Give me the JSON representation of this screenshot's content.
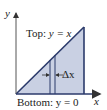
{
  "diagram": {
    "axes": {
      "x_label": "x",
      "y_label": "y"
    },
    "region": {
      "description": "triangle between y = x and y = 0",
      "fill_color": "#c9d0e3",
      "edge_color": "#2b3a6b"
    },
    "top_curve_label": {
      "prefix": "Top: ",
      "expr": "y = x"
    },
    "bottom_curve_label": {
      "prefix": "Bottom: ",
      "expr": "y = 0"
    },
    "strip_label": "Δx"
  }
}
